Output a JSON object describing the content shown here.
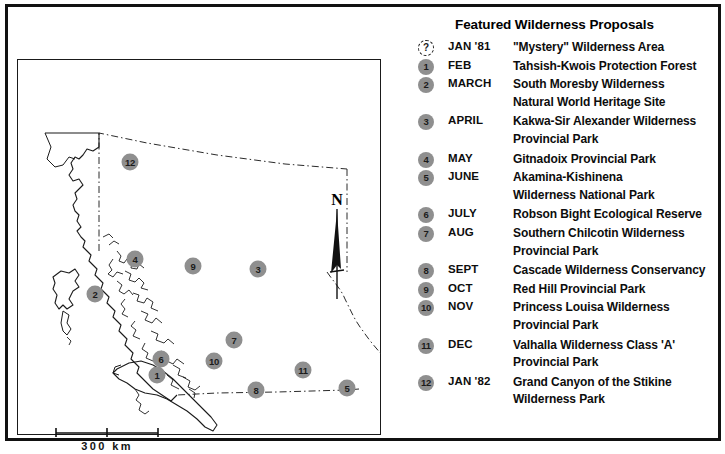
{
  "legend": {
    "title": "Featured Wilderness Proposals",
    "rows": [
      {
        "marker": "?",
        "mystery": true,
        "month": "JAN '81",
        "desc": [
          "\"Mystery\" Wilderness Area"
        ]
      },
      {
        "marker": "1",
        "month": "FEB",
        "desc": [
          "Tahsish-Kwois Protection Forest"
        ]
      },
      {
        "marker": "2",
        "month": "MARCH",
        "desc": [
          "South Moresby Wilderness",
          "Natural World Heritage Site"
        ]
      },
      {
        "marker": "3",
        "month": "APRIL",
        "desc": [
          "Kakwa-Sir Alexander Wilderness",
          "Provincial Park"
        ]
      },
      {
        "marker": "4",
        "month": "MAY",
        "desc": [
          "Gitnadoix Provincial Park"
        ]
      },
      {
        "marker": "5",
        "month": "JUNE",
        "desc": [
          "Akamina-Kishinena",
          "Wilderness National Park"
        ]
      },
      {
        "marker": "6",
        "month": "JULY",
        "desc": [
          "Robson Bight Ecological Reserve"
        ]
      },
      {
        "marker": "7",
        "month": "AUG",
        "desc": [
          "Southern Chilcotin Wilderness",
          "Provincial Park"
        ]
      },
      {
        "marker": "8",
        "month": "SEPT",
        "desc": [
          "Cascade Wilderness Conservancy"
        ]
      },
      {
        "marker": "9",
        "month": "OCT",
        "desc": [
          "Red Hill Provincial Park"
        ]
      },
      {
        "marker": "10",
        "month": "NOV",
        "desc": [
          "Princess Louisa Wilderness",
          "Provincial Park"
        ]
      },
      {
        "marker": "11",
        "month": "DEC",
        "desc": [
          "Valhalla Wilderness Class 'A'",
          "Provincial Park"
        ]
      },
      {
        "marker": "12",
        "month": "JAN '82",
        "desc": [
          "Grand Canyon of the Stikine",
          "Wilderness Park"
        ]
      }
    ]
  },
  "map": {
    "region": "British Columbia",
    "north_label": "N",
    "scale_label": "300  km",
    "scale_km": 300,
    "marker_color": "#8f8f8f",
    "markers": [
      {
        "label": "12",
        "x": 122,
        "y": 155
      },
      {
        "label": "4",
        "x": 127,
        "y": 252
      },
      {
        "label": "9",
        "x": 185,
        "y": 259
      },
      {
        "label": "3",
        "x": 250,
        "y": 262
      },
      {
        "label": "2",
        "x": 87,
        "y": 287
      },
      {
        "label": "7",
        "x": 226,
        "y": 333
      },
      {
        "label": "6",
        "x": 153,
        "y": 352
      },
      {
        "label": "10",
        "x": 206,
        "y": 354
      },
      {
        "label": "11",
        "x": 295,
        "y": 363
      },
      {
        "label": "1",
        "x": 149,
        "y": 368
      },
      {
        "label": "8",
        "x": 248,
        "y": 383
      },
      {
        "label": "5",
        "x": 339,
        "y": 381
      }
    ]
  }
}
